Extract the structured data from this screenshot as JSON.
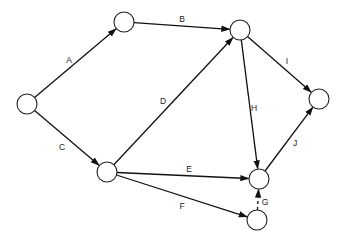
{
  "diagram": {
    "type": "directed network (activity-on-arrow)",
    "colors": {
      "stroke": "#111111",
      "node_fill": "#ffffff",
      "text": "#222222"
    },
    "nodes": [
      {
        "id": "n1",
        "x": 27,
        "y": 104,
        "r": 10
      },
      {
        "id": "n2",
        "x": 124,
        "y": 22,
        "r": 10
      },
      {
        "id": "n3",
        "x": 240,
        "y": 30,
        "r": 10
      },
      {
        "id": "n4",
        "x": 319,
        "y": 99,
        "r": 10
      },
      {
        "id": "n5",
        "x": 107,
        "y": 172,
        "r": 10
      },
      {
        "id": "n6",
        "x": 259,
        "y": 179,
        "r": 10
      },
      {
        "id": "n7",
        "x": 257,
        "y": 220,
        "r": 10
      }
    ],
    "edges": [
      {
        "label": "A",
        "from": "n1",
        "to": "n2",
        "style": "solid",
        "lx": 69,
        "ly": 63
      },
      {
        "label": "B",
        "from": "n2",
        "to": "n3",
        "style": "solid",
        "lx": 182,
        "ly": 22
      },
      {
        "label": "C",
        "from": "n1",
        "to": "n5",
        "style": "solid",
        "lx": 62,
        "ly": 150
      },
      {
        "label": "D",
        "from": "n5",
        "to": "n3",
        "style": "solid",
        "lx": 163,
        "ly": 104
      },
      {
        "label": "E",
        "from": "n5",
        "to": "n6",
        "style": "solid",
        "lx": 189,
        "ly": 172
      },
      {
        "label": "F",
        "from": "n5",
        "to": "n7",
        "style": "solid",
        "lx": 182,
        "ly": 209
      },
      {
        "label": "G",
        "from": "n7",
        "to": "n6",
        "style": "dashed",
        "lx": 265,
        "ly": 205
      },
      {
        "label": "H",
        "from": "n3",
        "to": "n6",
        "style": "solid",
        "lx": 254,
        "ly": 111
      },
      {
        "label": "I",
        "from": "n3",
        "to": "n4",
        "style": "solid",
        "lx": 287,
        "ly": 64
      },
      {
        "label": "J",
        "from": "n6",
        "to": "n4",
        "style": "solid",
        "lx": 295,
        "ly": 146
      }
    ]
  }
}
